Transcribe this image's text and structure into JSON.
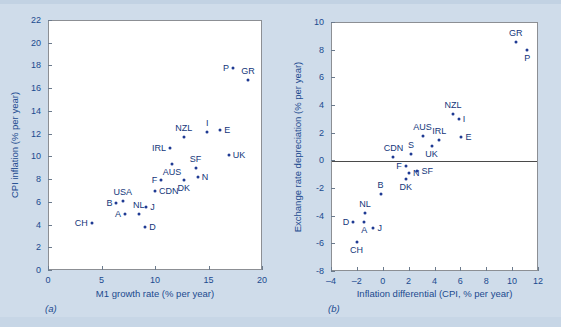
{
  "figure": {
    "background_color": "#cfdcea",
    "marker_color": "#1f3a93",
    "text_color": "#13367a",
    "panel_a_caption": "(a)",
    "panel_b_caption": "(b)"
  },
  "chart_data": [
    {
      "type": "scatter",
      "panel": "a",
      "title": "",
      "xlabel": "M1 growth rate (% per year)",
      "ylabel": "CPI inflation (% per year)",
      "xlim": [
        0,
        20
      ],
      "ylim": [
        0,
        22
      ],
      "xticks": [
        0,
        5,
        10,
        15,
        20
      ],
      "yticks": [
        0,
        2,
        4,
        6,
        8,
        10,
        12,
        14,
        16,
        18,
        20,
        22
      ],
      "grid": false,
      "legend": "none",
      "points": [
        {
          "label": "CH",
          "x": 4.0,
          "y": 4.2,
          "label_pos": "left"
        },
        {
          "label": "B",
          "x": 6.3,
          "y": 6.0,
          "label_pos": "left"
        },
        {
          "label": "A",
          "x": 7.1,
          "y": 5.0,
          "label_pos": "left"
        },
        {
          "label": "USA",
          "x": 6.9,
          "y": 6.2,
          "label_pos": "above"
        },
        {
          "label": "NL",
          "x": 8.4,
          "y": 5.0,
          "label_pos": "above"
        },
        {
          "label": "J",
          "x": 9.1,
          "y": 5.6,
          "label_pos": "right"
        },
        {
          "label": "D",
          "x": 9.0,
          "y": 3.9,
          "label_pos": "right"
        },
        {
          "label": "CDN",
          "x": 9.9,
          "y": 7.0,
          "label_pos": "right"
        },
        {
          "label": "F",
          "x": 10.5,
          "y": 8.05,
          "label_pos": "left"
        },
        {
          "label": "IRL",
          "x": 11.3,
          "y": 10.8,
          "label_pos": "left"
        },
        {
          "label": "AUS",
          "x": 11.5,
          "y": 9.4,
          "label_pos": "below"
        },
        {
          "label": "NZL",
          "x": 12.6,
          "y": 11.8,
          "label_pos": "above"
        },
        {
          "label": "DK",
          "x": 12.6,
          "y": 8.0,
          "label_pos": "below"
        },
        {
          "label": "SF",
          "x": 13.7,
          "y": 9.1,
          "label_pos": "above"
        },
        {
          "label": "N",
          "x": 13.9,
          "y": 8.25,
          "label_pos": "right"
        },
        {
          "label": "I",
          "x": 14.8,
          "y": 12.2,
          "label_pos": "above"
        },
        {
          "label": "E",
          "x": 16.0,
          "y": 12.4,
          "label_pos": "right"
        },
        {
          "label": "UK",
          "x": 16.8,
          "y": 10.25,
          "label_pos": "right"
        },
        {
          "label": "P",
          "x": 17.2,
          "y": 17.9,
          "label_pos": "left"
        },
        {
          "label": "GR",
          "x": 18.6,
          "y": 16.85,
          "label_pos": "above"
        }
      ]
    },
    {
      "type": "scatter",
      "panel": "b",
      "title": "",
      "xlabel": "Inflation differential (CPI, % per year)",
      "ylabel": "Exchange rate depreciation (% per year)",
      "xlim": [
        -4,
        12
      ],
      "ylim": [
        -8,
        10
      ],
      "xticks": [
        -4,
        -2,
        0,
        2,
        4,
        6,
        8,
        10,
        12
      ],
      "yticks": [
        -8,
        -6,
        -4,
        -2,
        0,
        2,
        4,
        6,
        8,
        10
      ],
      "grid": false,
      "zero_line_y": 0,
      "legend": "none",
      "points": [
        {
          "label": "D",
          "x": -2.35,
          "y": -4.35,
          "label_pos": "left"
        },
        {
          "label": "CH",
          "x": -2.1,
          "y": -5.85,
          "label_pos": "below"
        },
        {
          "label": "A",
          "x": -1.5,
          "y": -4.4,
          "label_pos": "below"
        },
        {
          "label": "NL",
          "x": -1.45,
          "y": -3.7,
          "label_pos": "above"
        },
        {
          "label": "J",
          "x": -0.8,
          "y": -4.8,
          "label_pos": "right"
        },
        {
          "label": "B",
          "x": -0.25,
          "y": -2.35,
          "label_pos": "above"
        },
        {
          "label": "CDN",
          "x": 0.75,
          "y": 0.3,
          "label_pos": "above"
        },
        {
          "label": "F",
          "x": 1.7,
          "y": -0.35,
          "label_pos": "left"
        },
        {
          "label": "DK",
          "x": 1.7,
          "y": -1.25,
          "label_pos": "below"
        },
        {
          "label": "N",
          "x": 1.95,
          "y": -0.85,
          "label_pos": "right"
        },
        {
          "label": "S",
          "x": 2.1,
          "y": 0.55,
          "label_pos": "above"
        },
        {
          "label": "SF",
          "x": 2.6,
          "y": -0.7,
          "label_pos": "right"
        },
        {
          "label": "AUS",
          "x": 3.0,
          "y": 1.85,
          "label_pos": "above"
        },
        {
          "label": "UK",
          "x": 3.7,
          "y": 1.1,
          "label_pos": "below"
        },
        {
          "label": "IRL",
          "x": 4.3,
          "y": 1.55,
          "label_pos": "above"
        },
        {
          "label": "NZL",
          "x": 5.35,
          "y": 3.4,
          "label_pos": "above"
        },
        {
          "label": "I",
          "x": 5.8,
          "y": 3.05,
          "label_pos": "right"
        },
        {
          "label": "E",
          "x": 6.0,
          "y": 1.75,
          "label_pos": "right"
        },
        {
          "label": "GR",
          "x": 10.2,
          "y": 8.65,
          "label_pos": "above"
        },
        {
          "label": "P",
          "x": 11.1,
          "y": 8.05,
          "label_pos": "below"
        }
      ]
    }
  ]
}
